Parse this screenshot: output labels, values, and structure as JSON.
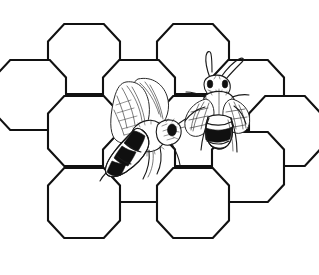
{
  "artwork": {
    "title": "Bees on Honeycomb",
    "style": "black-and-white line art / coloring page",
    "background_color": "#ffffff",
    "line_color": "#111111",
    "width": 319,
    "height": 275
  },
  "honeycomb": {
    "name": "honeycomb-grid",
    "cell_shape": "hexagon",
    "cell_orientation": "flat-top",
    "cell_count": 12,
    "cell_width": 72,
    "cell_height": 70,
    "cells": [
      {
        "id": "cell-r1-c1",
        "row": 1,
        "col": 1,
        "cx": 84,
        "cy": 59
      },
      {
        "id": "cell-r1-c2",
        "row": 1,
        "col": 2,
        "cx": 193,
        "cy": 59
      },
      {
        "id": "cell-r2-c1",
        "row": 2,
        "col": 1,
        "cx": 30,
        "cy": 95
      },
      {
        "id": "cell-r2-c2",
        "row": 2,
        "col": 2,
        "cx": 139,
        "cy": 95
      },
      {
        "id": "cell-r2-c3",
        "row": 2,
        "col": 3,
        "cx": 248,
        "cy": 95
      },
      {
        "id": "cell-r3-c1",
        "row": 3,
        "col": 1,
        "cx": 84,
        "cy": 131
      },
      {
        "id": "cell-r3-c2",
        "row": 3,
        "col": 2,
        "cx": 193,
        "cy": 131
      },
      {
        "id": "cell-r3-c3",
        "row": 3,
        "col": 3,
        "cx": 285,
        "cy": 131
      },
      {
        "id": "cell-r4-c1",
        "row": 4,
        "col": 1,
        "cx": 139,
        "cy": 167
      },
      {
        "id": "cell-r4-c2",
        "row": 4,
        "col": 2,
        "cx": 248,
        "cy": 167
      },
      {
        "id": "cell-r5-c1",
        "row": 5,
        "col": 1,
        "cx": 84,
        "cy": 203
      },
      {
        "id": "cell-r5-c2",
        "row": 5,
        "col": 2,
        "cx": 193,
        "cy": 203
      }
    ]
  },
  "bees": [
    {
      "id": "bee-left",
      "label": "Left bee",
      "pose": "side view, head lower-right, wings raised",
      "abdomen_pattern": "black and white stripes",
      "stripe_count": 5,
      "wing_count": 2,
      "leg_count": 3,
      "antenna_count": 1,
      "center_x": 140,
      "center_y": 125
    },
    {
      "id": "bee-right",
      "label": "Right bee",
      "pose": "top-down view, head up, legs spread",
      "abdomen_pattern": "dark tip with light bands",
      "stripe_count": 4,
      "wing_count": 2,
      "leg_count": 6,
      "antenna_count": 2,
      "center_x": 218,
      "center_y": 100
    }
  ]
}
